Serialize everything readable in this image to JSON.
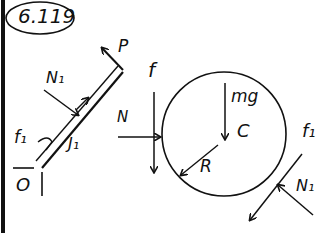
{
  "figure": {
    "problem_number": "6.119",
    "left_part": {
      "description": "Rod leaning against disk, pinned at O",
      "labels": {
        "force_p": "P",
        "normal_n1": "N₁",
        "friction_f1": "f₁",
        "reaction_j1": "J₁",
        "pivot_o": "O"
      }
    },
    "right_part": {
      "description": "Disk free-body diagram",
      "labels": {
        "friction_f": "f",
        "normal_n": "N",
        "weight_mg": "mg",
        "center_c": "C",
        "radius_r": "R",
        "friction_f1": "f₁",
        "normal_n1": "N₁"
      }
    },
    "colors": {
      "ink": "#111111",
      "background": "#ffffff"
    }
  }
}
